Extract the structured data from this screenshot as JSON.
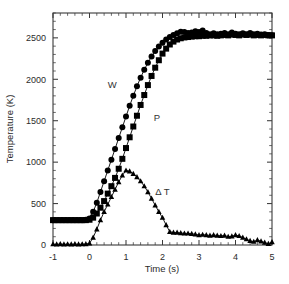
{
  "chart_data": {
    "type": "line",
    "title": "",
    "xlabel": "Time (s)",
    "ylabel": "Temperature (K)",
    "xlim": [
      -1,
      5
    ],
    "ylim": [
      0,
      2800
    ],
    "xticks": [
      -1,
      0,
      1,
      2,
      3,
      4,
      5
    ],
    "xtick_labels": [
      "-1",
      "0",
      "1",
      "2",
      "3",
      "4",
      "5"
    ],
    "yticks": [
      0,
      500,
      1000,
      1500,
      2000,
      2500
    ],
    "ytick_labels": [
      "0",
      "500",
      "1000",
      "1500",
      "2000",
      "2500"
    ],
    "x_minor_per_major": 5,
    "y_minor_per_major": 5,
    "grid": false,
    "legend": "inline-annotations",
    "frame": "box",
    "tick_direction": "in",
    "annotations": [
      {
        "text": "W",
        "x": 0.62,
        "y": 1900
      },
      {
        "text": "P",
        "x": 1.85,
        "y": 1500
      },
      {
        "text": "Δ T",
        "x": 2.0,
        "y": 600
      }
    ],
    "series": [
      {
        "name": "W",
        "label": "W",
        "marker": "circle",
        "marker_size": 3.0,
        "color": "#000000",
        "x": [
          -1.0,
          -0.9,
          -0.8,
          -0.7,
          -0.6,
          -0.5,
          -0.4,
          -0.3,
          -0.2,
          -0.1,
          0.0,
          0.1,
          0.2,
          0.3,
          0.4,
          0.5,
          0.6,
          0.7,
          0.8,
          0.9,
          1.0,
          1.1,
          1.2,
          1.3,
          1.4,
          1.5,
          1.6,
          1.7,
          1.8,
          1.9,
          2.0,
          2.1,
          2.2,
          2.3,
          2.4,
          2.5,
          2.6,
          2.7,
          2.8,
          2.9,
          3.0,
          3.1,
          3.2,
          3.3,
          3.4,
          3.5,
          3.6,
          3.7,
          3.8,
          3.9,
          4.0,
          4.1,
          4.2,
          4.3,
          4.4,
          4.5,
          4.6,
          4.7,
          4.8,
          4.9,
          5.0
        ],
        "y": [
          300,
          300,
          300,
          300,
          300,
          300,
          300,
          300,
          300,
          305,
          320,
          400,
          510,
          640,
          770,
          900,
          1030,
          1160,
          1290,
          1420,
          1550,
          1680,
          1800,
          1915,
          2020,
          2115,
          2200,
          2275,
          2340,
          2395,
          2440,
          2480,
          2510,
          2535,
          2555,
          2575,
          2570,
          2560,
          2565,
          2580,
          2570,
          2590,
          2560,
          2545,
          2555,
          2545,
          2550,
          2560,
          2545,
          2565,
          2550,
          2545,
          2555,
          2545,
          2560,
          2545,
          2550,
          2540,
          2545,
          2535,
          2530
        ]
      },
      {
        "name": "P",
        "label": "P",
        "marker": "square",
        "marker_size": 3.0,
        "color": "#000000",
        "x": [
          -1.0,
          -0.9,
          -0.8,
          -0.7,
          -0.6,
          -0.5,
          -0.4,
          -0.3,
          -0.2,
          -0.1,
          0.0,
          0.1,
          0.2,
          0.3,
          0.4,
          0.5,
          0.6,
          0.7,
          0.8,
          0.9,
          1.0,
          1.1,
          1.2,
          1.3,
          1.4,
          1.5,
          1.6,
          1.7,
          1.8,
          1.9,
          2.0,
          2.1,
          2.2,
          2.3,
          2.4,
          2.5,
          2.6,
          2.7,
          2.8,
          2.9,
          3.0,
          3.1,
          3.2,
          3.3,
          3.4,
          3.5,
          3.6,
          3.7,
          3.8,
          3.9,
          4.0,
          4.1,
          4.2,
          4.3,
          4.4,
          4.5,
          4.6,
          4.7,
          4.8,
          4.9,
          5.0
        ],
        "y": [
          300,
          300,
          300,
          300,
          300,
          300,
          300,
          300,
          300,
          300,
          305,
          330,
          380,
          450,
          530,
          620,
          710,
          810,
          920,
          1040,
          1170,
          1300,
          1430,
          1560,
          1690,
          1810,
          1930,
          2040,
          2140,
          2230,
          2310,
          2370,
          2420,
          2455,
          2480,
          2495,
          2505,
          2510,
          2515,
          2520,
          2520,
          2525,
          2525,
          2530,
          2530,
          2525,
          2530,
          2535,
          2530,
          2540,
          2535,
          2530,
          2540,
          2535,
          2540,
          2530,
          2535,
          2530,
          2535,
          2530,
          2530
        ]
      },
      {
        "name": "Delta T",
        "label": "Δ T",
        "marker": "triangle",
        "marker_size": 2.4,
        "color": "#000000",
        "x": [
          -1.0,
          -0.9,
          -0.8,
          -0.7,
          -0.6,
          -0.5,
          -0.4,
          -0.3,
          -0.2,
          -0.1,
          0.0,
          0.1,
          0.2,
          0.3,
          0.4,
          0.5,
          0.6,
          0.7,
          0.8,
          0.9,
          1.0,
          1.1,
          1.2,
          1.3,
          1.4,
          1.5,
          1.6,
          1.7,
          1.8,
          1.9,
          2.0,
          2.1,
          2.2,
          2.3,
          2.4,
          2.5,
          2.6,
          2.7,
          2.8,
          2.9,
          3.0,
          3.1,
          3.2,
          3.3,
          3.4,
          3.5,
          3.6,
          3.7,
          3.8,
          3.9,
          4.0,
          4.1,
          4.2,
          4.3,
          4.4,
          4.5,
          4.6,
          4.7,
          4.8,
          4.9,
          5.0
        ],
        "y": [
          10,
          8,
          12,
          8,
          10,
          8,
          12,
          8,
          10,
          12,
          20,
          90,
          190,
          300,
          400,
          490,
          580,
          670,
          760,
          840,
          900,
          890,
          860,
          820,
          770,
          710,
          640,
          560,
          480,
          400,
          330,
          240,
          160,
          150,
          150,
          145,
          140,
          140,
          135,
          130,
          120,
          125,
          120,
          115,
          120,
          115,
          110,
          115,
          100,
          105,
          120,
          110,
          90,
          70,
          50,
          40,
          60,
          45,
          30,
          15,
          35
        ]
      }
    ]
  },
  "axes": {
    "ylabel_text": "Temperature (K)",
    "xlabel_text": "Time (s)"
  }
}
